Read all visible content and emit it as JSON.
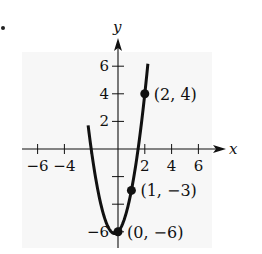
{
  "chart_data": {
    "type": "line",
    "title": "",
    "xlabel": "x",
    "ylabel": "y",
    "xlim": [
      -7.5,
      7
    ],
    "ylim": [
      -6.5,
      7.5
    ],
    "x_ticks": [
      -6,
      -4,
      2,
      4,
      6
    ],
    "x_tick_labels": [
      "−6",
      "−4",
      "2",
      "4",
      "6"
    ],
    "x_tick_marks": [
      -6,
      -4,
      -2,
      2,
      4,
      6
    ],
    "y_ticks": [
      2,
      4,
      6,
      -6
    ],
    "y_tick_labels": [
      "2",
      "4",
      "6",
      "−6"
    ],
    "y_tick_marks": [
      -6,
      -4,
      -2,
      2,
      4,
      6
    ],
    "function": "y = 2x^2 + x - 6",
    "series": [
      {
        "name": "parabola",
        "coefficients": {
          "a": 2,
          "b": 1,
          "c": -6
        },
        "x_range": [
          -2.23,
          2.23
        ]
      }
    ],
    "points": [
      {
        "x": 2,
        "y": 4,
        "label": "(2, 4)"
      },
      {
        "x": 1,
        "y": -3,
        "label": "(1, −3)"
      },
      {
        "x": 0,
        "y": -6,
        "label": "(0, −6)"
      }
    ],
    "grid": false,
    "legend": null
  },
  "colors": {
    "panel": "#f7f7f7",
    "ink": "#111111",
    "background": "#ffffff"
  }
}
